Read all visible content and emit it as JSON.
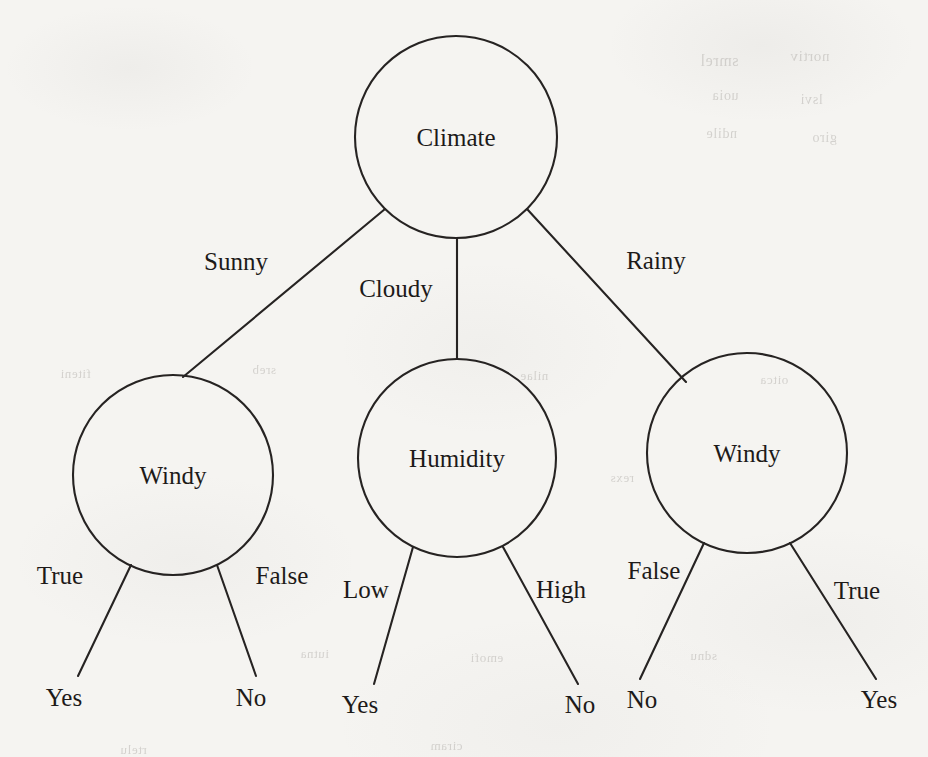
{
  "diagram": {
    "type": "decision-tree",
    "stroke_color": "#262322",
    "text_color": "#1d1a19",
    "background_color": "#f5f4f1"
  },
  "nodes": {
    "root": {
      "label": "Climate",
      "cx": 456,
      "cy": 137,
      "r": 101
    },
    "left": {
      "label": "Windy",
      "cx": 173,
      "cy": 475,
      "r": 100
    },
    "middle": {
      "label": "Humidity",
      "cx": 457,
      "cy": 458,
      "r": 99
    },
    "right": {
      "label": "Windy",
      "cx": 747,
      "cy": 453,
      "r": 100
    }
  },
  "edge_labels": {
    "root_left": {
      "text": "Sunny",
      "x": 236,
      "y": 264
    },
    "root_middle": {
      "text": "Cloudy",
      "x": 396,
      "y": 291
    },
    "root_right": {
      "text": "Rainy",
      "x": 656,
      "y": 263
    },
    "left_left": {
      "text": "True",
      "x": 60,
      "y": 578
    },
    "left_right": {
      "text": "False",
      "x": 282,
      "y": 578
    },
    "middle_left": {
      "text": "Low",
      "x": 366,
      "y": 592
    },
    "middle_right": {
      "text": "High",
      "x": 561,
      "y": 592
    },
    "right_left": {
      "text": "False",
      "x": 654,
      "y": 573
    },
    "right_right": {
      "text": "True",
      "x": 857,
      "y": 593
    }
  },
  "leaves": {
    "left_yes": {
      "text": "Yes",
      "x": 64,
      "y": 700
    },
    "left_no": {
      "text": "No",
      "x": 251,
      "y": 700
    },
    "middle_yes": {
      "text": "Yes",
      "x": 360,
      "y": 707
    },
    "middle_no": {
      "text": "No",
      "x": 580,
      "y": 707
    },
    "right_no": {
      "text": "No",
      "x": 642,
      "y": 702
    },
    "right_yes": {
      "text": "Yes",
      "x": 879,
      "y": 702
    }
  },
  "tree_structure": {
    "root_attribute": "Climate",
    "branches": [
      {
        "value": "Sunny",
        "node": "Windy",
        "children": [
          {
            "value": "True",
            "decision": "Yes"
          },
          {
            "value": "False",
            "decision": "No"
          }
        ]
      },
      {
        "value": "Cloudy",
        "node": "Humidity",
        "children": [
          {
            "value": "Low",
            "decision": "Yes"
          },
          {
            "value": "High",
            "decision": "No"
          }
        ]
      },
      {
        "value": "Rainy",
        "node": "Windy",
        "children": [
          {
            "value": "False",
            "decision": "No"
          },
          {
            "value": "True",
            "decision": "Yes"
          }
        ]
      }
    ]
  },
  "scan_artifacts": {
    "ghost_lines": [
      {
        "text": "smrel",
        "x": 700,
        "y": 52,
        "size": 16
      },
      {
        "text": "nortiv",
        "x": 790,
        "y": 48,
        "size": 15
      },
      {
        "text": "uoia",
        "x": 712,
        "y": 88,
        "size": 14
      },
      {
        "text": "lsvi",
        "x": 800,
        "y": 92,
        "size": 14
      },
      {
        "text": "ndile",
        "x": 706,
        "y": 126,
        "size": 14
      },
      {
        "text": "giro",
        "x": 812,
        "y": 130,
        "size": 14
      },
      {
        "text": "fiteni",
        "x": 60,
        "y": 366,
        "size": 13
      },
      {
        "text": "sreb",
        "x": 252,
        "y": 362,
        "size": 13
      },
      {
        "text": "nilae",
        "x": 520,
        "y": 368,
        "size": 13
      },
      {
        "text": "oitca",
        "x": 760,
        "y": 372,
        "size": 13
      },
      {
        "text": "rexs",
        "x": 610,
        "y": 470,
        "size": 13
      },
      {
        "text": "iutna",
        "x": 300,
        "y": 646,
        "size": 13
      },
      {
        "text": "emofi",
        "x": 470,
        "y": 650,
        "size": 13
      },
      {
        "text": "sdnu",
        "x": 690,
        "y": 648,
        "size": 13
      },
      {
        "text": "rtelu",
        "x": 120,
        "y": 742,
        "size": 13
      },
      {
        "text": "ciram",
        "x": 430,
        "y": 738,
        "size": 13
      }
    ]
  }
}
